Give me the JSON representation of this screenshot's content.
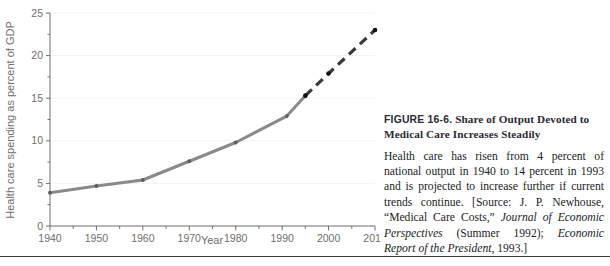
{
  "chart_data": {
    "type": "line",
    "title": "",
    "xlabel": "Year",
    "ylabel": "Health care spending as percent of GDP",
    "xlim": [
      1940,
      2010
    ],
    "ylim": [
      0,
      25
    ],
    "xticks": [
      1940,
      1950,
      1960,
      1970,
      1980,
      1990,
      2000,
      2010
    ],
    "xtick_labels": [
      "1940",
      "1950",
      "1960",
      "1970",
      "1980",
      "1990",
      "2000",
      "2010"
    ],
    "x_minor_ticks": [
      1945,
      1955,
      1965,
      1975,
      1985,
      1995,
      2005
    ],
    "yticks": [
      0,
      5,
      10,
      15,
      20,
      25
    ],
    "ytick_labels": [
      "0",
      "5",
      "10",
      "15",
      "20",
      "25"
    ],
    "y_minor_ticks": [
      2.5,
      7.5,
      12.5,
      17.5,
      22.5
    ],
    "grid": "horizontal-major-faint",
    "legend": "none",
    "series": [
      {
        "name": "Actual health care spending",
        "style": "solid",
        "color": "#8a8a8a",
        "x": [
          1940,
          1950,
          1960,
          1970,
          1980,
          1991,
          1995
        ],
        "values": [
          3.9,
          4.7,
          5.4,
          7.6,
          9.8,
          12.9,
          15.3
        ]
      },
      {
        "name": "Projected health care spending",
        "style": "dashed",
        "color": "#3a3a3a",
        "x": [
          1995,
          2000,
          2010
        ],
        "values": [
          15.3,
          17.9,
          23.0
        ]
      }
    ]
  },
  "caption": {
    "figure_number": "FIGURE 16-6.",
    "title": "Share of Output Devoted to Medical Care Increases Steadily",
    "body_pre": "Health care has risen from 4 percent of national output in 1940 to 14 percent in 1993 and is projected to increase further if current trends continue. [Source: J. P. Newhouse, “Medical Care Costs,” ",
    "body_italic_1": "Journal of Economic Perspectives",
    "body_mid": " (Summer 1992); ",
    "body_italic_2": "Economic Report of the President",
    "body_post": ", 1993.]"
  },
  "colors": {
    "actual_line": "#8a8a8a",
    "projected_line": "#3a3a3a",
    "axis": "#6e6e6e",
    "gridline": "#f2f2f4",
    "rule": "#3b3b42"
  }
}
